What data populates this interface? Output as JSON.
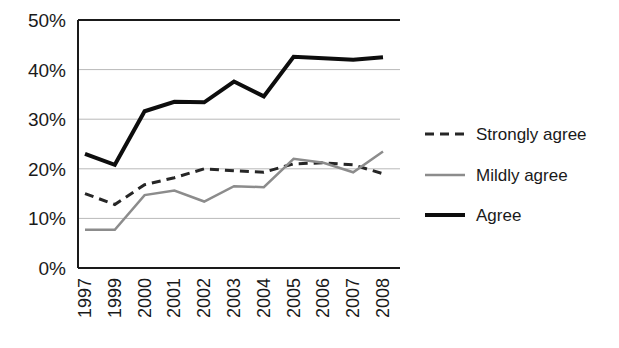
{
  "chart_data": {
    "type": "line",
    "title": "",
    "subtitle": "",
    "xlabel": "",
    "ylabel": "",
    "categories": [
      "1997",
      "1999",
      "2000",
      "2001",
      "2002",
      "2003",
      "2004",
      "2005",
      "2006",
      "2007",
      "2008"
    ],
    "ylim": [
      0,
      50
    ],
    "ytick_labels": [
      "0%",
      "10%",
      "20%",
      "30%",
      "40%",
      "50%"
    ],
    "ytick_values": [
      0,
      10,
      20,
      30,
      40,
      50
    ],
    "grid": true,
    "grid_axis": "y",
    "legend_position": "right",
    "series": [
      {
        "name": "Strongly agree",
        "style": "dashed",
        "color": "#262626",
        "width": 3,
        "values": [
          15.0,
          12.8,
          16.8,
          18.2,
          20.0,
          19.6,
          19.3,
          21.0,
          21.2,
          20.8,
          19.0
        ]
      },
      {
        "name": "Mildly agree",
        "style": "solid",
        "color": "#8c8c8c",
        "width": 2.5,
        "values": [
          7.7,
          7.7,
          14.7,
          15.6,
          13.4,
          16.5,
          16.3,
          22.0,
          21.2,
          19.3,
          23.5
        ]
      },
      {
        "name": "Agree",
        "style": "solid",
        "color": "#0d0d0d",
        "width": 4,
        "values": [
          23.0,
          20.8,
          31.6,
          33.5,
          33.4,
          37.6,
          34.6,
          42.6,
          42.3,
          42.0,
          42.5
        ]
      }
    ]
  },
  "axes": {
    "y_axis_name": "percentage-axis",
    "x_axis_name": "year-axis"
  },
  "legend": {
    "items": [
      {
        "label": "Strongly agree",
        "swatch": "dashed-line-swatch"
      },
      {
        "label": "Mildly agree",
        "swatch": "gray-line-swatch"
      },
      {
        "label": "Agree",
        "swatch": "black-line-swatch"
      }
    ]
  },
  "colors": {
    "strongly_agree": "#262626",
    "mildly_agree": "#8c8c8c",
    "agree": "#0d0d0d",
    "grid": "#b9b9b9",
    "axis": "#1a1a1a",
    "background": "#ffffff"
  }
}
